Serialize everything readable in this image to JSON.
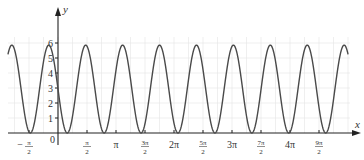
{
  "chart_data": {
    "type": "line",
    "title": "",
    "xlabel": "x",
    "ylabel": "y",
    "origin_label": "0",
    "grid": true,
    "grid_x_step": "π/4",
    "grid_y_step": 1,
    "legend": "none",
    "xlim": [
      -2.71,
      15.71
    ],
    "ylim": [
      -0.7,
      8.3
    ],
    "x_ticks": [
      {
        "label": "−π/2",
        "half_pi_multiple": -1,
        "sign": "−",
        "numerator": "π",
        "denominator": "2"
      },
      {
        "label": "π/2",
        "half_pi_multiple": 1,
        "sign": "",
        "numerator": "π",
        "denominator": "2"
      },
      {
        "label": "π",
        "half_pi_multiple": 2,
        "text": "π"
      },
      {
        "label": "3π/2",
        "half_pi_multiple": 3,
        "sign": "",
        "numerator": "3π",
        "denominator": "2"
      },
      {
        "label": "2π",
        "half_pi_multiple": 4,
        "text": "2π"
      },
      {
        "label": "5π/2",
        "half_pi_multiple": 5,
        "sign": "",
        "numerator": "5π",
        "denominator": "2"
      },
      {
        "label": "3π",
        "half_pi_multiple": 6,
        "text": "3π"
      },
      {
        "label": "7π/2",
        "half_pi_multiple": 7,
        "sign": "",
        "numerator": "7π",
        "denominator": "2"
      },
      {
        "label": "4π",
        "half_pi_multiple": 8,
        "text": "4π"
      },
      {
        "label": "9π/2",
        "half_pi_multiple": 9,
        "sign": "",
        "numerator": "9π",
        "denominator": "2"
      }
    ],
    "y_ticks": [
      1,
      2,
      3,
      4,
      5,
      6
    ],
    "series": [
      {
        "name": "curve",
        "color": "#4a4a4a",
        "model": {
          "form": "a - a*sin(pi*x)",
          "a": 2.93
        },
        "x": [
          -2.71,
          -2.5,
          -2,
          -1.5,
          -1,
          -0.5,
          0,
          0.5,
          1,
          1.5,
          2,
          2.5,
          3,
          3.5,
          4,
          4.5,
          5,
          5.5,
          6,
          6.5,
          7,
          7.5,
          8,
          8.5,
          9,
          9.5,
          10,
          10.5,
          11,
          11.5,
          12,
          12.5,
          13,
          13.5,
          14,
          14.5,
          15,
          15.5,
          15.71
        ],
        "y": [
          5.25,
          5.86,
          2.93,
          0,
          2.93,
          5.86,
          2.93,
          0,
          2.93,
          5.86,
          2.93,
          0,
          2.93,
          5.86,
          2.93,
          0,
          2.93,
          5.86,
          2.93,
          0,
          2.93,
          5.86,
          2.93,
          0,
          2.93,
          5.86,
          2.93,
          0,
          2.93,
          5.86,
          2.93,
          0,
          2.93,
          5.86,
          2.93,
          0,
          2.93,
          5.86,
          5.25
        ]
      }
    ]
  }
}
